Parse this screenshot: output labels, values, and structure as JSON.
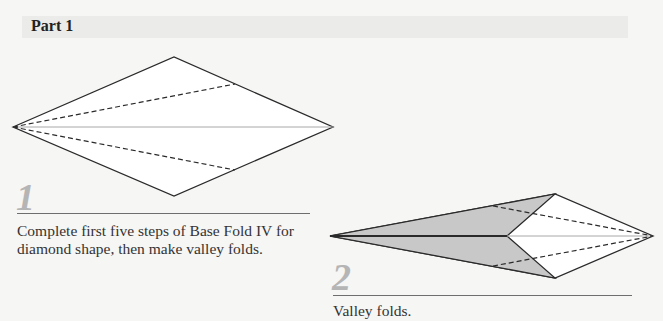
{
  "header": {
    "title": "Part 1"
  },
  "steps": [
    {
      "number": "1",
      "caption": "Complete first five steps of Base Fold IV for diamond shape, then make valley folds."
    },
    {
      "number": "2",
      "caption": "Valley folds."
    }
  ],
  "colors": {
    "header_band": "#ebebea",
    "step_number": "#b5b5b5",
    "flap_fill": "#c8c8c8",
    "outline": "#2a2a2a",
    "center_line": "#a8a8a8"
  }
}
